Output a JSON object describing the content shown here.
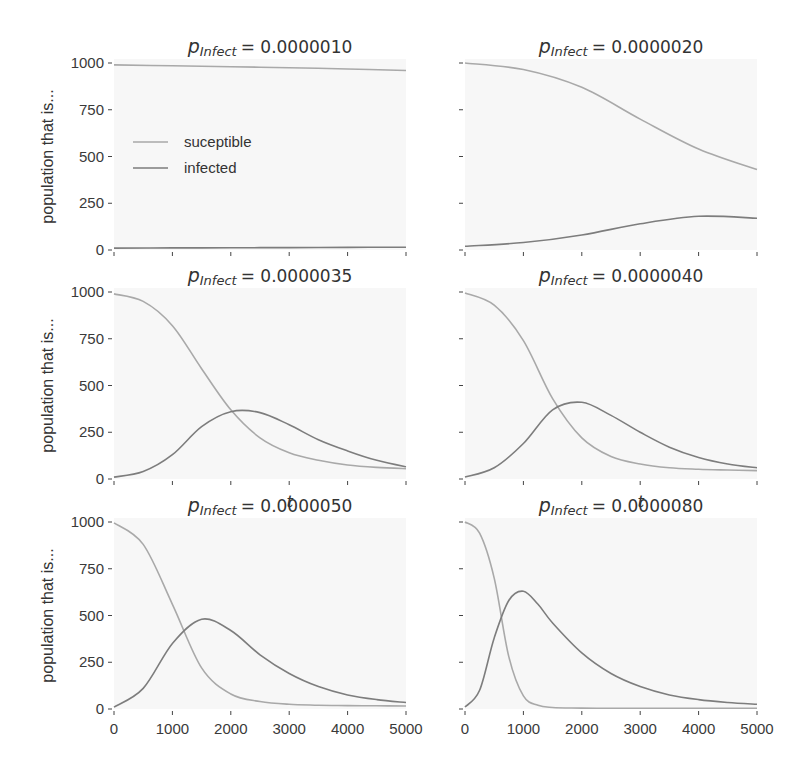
{
  "figure": {
    "ylabel": "population that is...",
    "xlabel": "t",
    "legend": [
      {
        "label": "suceptible",
        "color": "#a9a9a9"
      },
      {
        "label": "infected",
        "color": "#7d7d7d"
      }
    ],
    "colors": {
      "background": "#f7f7f7",
      "susceptible": "#a9a9a9",
      "infected": "#7d7d7d",
      "axis": "#444444"
    }
  },
  "chart_data": [
    {
      "type": "line",
      "title": "p_Infect = 0.0000010",
      "title_prefix": "p",
      "title_sub": "Infect",
      "title_value": "= 0.0000010",
      "xlabel": "",
      "ylabel": "population that is...",
      "xlim": [
        0,
        5000
      ],
      "ylim": [
        0,
        1000
      ],
      "x": [
        0,
        1000,
        2000,
        3000,
        4000,
        5000
      ],
      "series": [
        {
          "name": "suceptible",
          "values": [
            990,
            985,
            980,
            975,
            968,
            960
          ]
        },
        {
          "name": "infected",
          "values": [
            10,
            11,
            12,
            13,
            14,
            15
          ]
        }
      ]
    },
    {
      "type": "line",
      "title": "p_Infect = 0.0000020",
      "title_prefix": "p",
      "title_sub": "Infect",
      "title_value": "= 0.0000020",
      "xlabel": "",
      "ylabel": "",
      "xlim": [
        0,
        5000
      ],
      "ylim": [
        0,
        1000
      ],
      "x": [
        0,
        1000,
        2000,
        3000,
        4000,
        5000
      ],
      "series": [
        {
          "name": "suceptible",
          "values": [
            1000,
            965,
            870,
            700,
            540,
            430
          ]
        },
        {
          "name": "infected",
          "values": [
            20,
            40,
            80,
            140,
            180,
            170
          ]
        }
      ]
    },
    {
      "type": "line",
      "title": "p_Infect = 0.0000035",
      "title_prefix": "p",
      "title_sub": "Infect",
      "title_value": "= 0.0000035",
      "xlabel": "",
      "ylabel": "population that is...",
      "xlim": [
        0,
        5000
      ],
      "ylim": [
        0,
        1000
      ],
      "x": [
        0,
        500,
        1000,
        1500,
        2000,
        2500,
        3000,
        3500,
        4000,
        4500,
        5000
      ],
      "series": [
        {
          "name": "suceptible",
          "values": [
            990,
            950,
            820,
            590,
            370,
            220,
            140,
            100,
            75,
            62,
            55
          ]
        },
        {
          "name": "infected",
          "values": [
            10,
            40,
            130,
            280,
            360,
            355,
            290,
            210,
            150,
            100,
            65
          ]
        }
      ]
    },
    {
      "type": "line",
      "title": "p_Infect = 0.0000040",
      "title_prefix": "p",
      "title_sub": "Infect",
      "title_value": "= 0.0000040",
      "xlabel": "",
      "ylabel": "",
      "xlim": [
        0,
        5000
      ],
      "ylim": [
        0,
        1000
      ],
      "x": [
        0,
        500,
        1000,
        1500,
        2000,
        2500,
        3000,
        3500,
        4000,
        4500,
        5000
      ],
      "series": [
        {
          "name": "suceptible",
          "values": [
            995,
            930,
            740,
            430,
            220,
            120,
            80,
            60,
            52,
            48,
            45
          ]
        },
        {
          "name": "infected",
          "values": [
            10,
            60,
            190,
            370,
            410,
            340,
            250,
            170,
            115,
            80,
            60
          ]
        }
      ]
    },
    {
      "type": "line",
      "title": "p_Infect = 0.0000050",
      "title_prefix": "p",
      "title_sub": "Infect",
      "title_value": "= 0.0000050",
      "xlabel": "t",
      "ylabel": "population that is...",
      "xlim": [
        0,
        5000
      ],
      "ylim": [
        0,
        1000
      ],
      "x": [
        0,
        500,
        1000,
        1500,
        2000,
        2500,
        3000,
        3500,
        4000,
        4500,
        5000
      ],
      "series": [
        {
          "name": "suceptible",
          "values": [
            995,
            880,
            560,
            220,
            80,
            40,
            25,
            20,
            18,
            17,
            16
          ]
        },
        {
          "name": "infected",
          "values": [
            10,
            110,
            350,
            480,
            420,
            290,
            190,
            120,
            75,
            50,
            35
          ]
        }
      ]
    },
    {
      "type": "line",
      "title": "p_Infect = 0.0000080",
      "title_prefix": "p",
      "title_sub": "Infect",
      "title_value": "= 0.0000080",
      "xlabel": "t",
      "ylabel": "",
      "xlim": [
        0,
        5000
      ],
      "ylim": [
        0,
        1000
      ],
      "x": [
        0,
        250,
        500,
        750,
        1000,
        1250,
        1500,
        2000,
        2500,
        3000,
        3500,
        4000,
        4500,
        5000
      ],
      "series": [
        {
          "name": "suceptible",
          "values": [
            1000,
            940,
            700,
            280,
            70,
            20,
            8,
            5,
            4,
            4,
            4,
            4,
            4,
            4
          ]
        },
        {
          "name": "infected",
          "values": [
            10,
            100,
            380,
            580,
            630,
            560,
            460,
            300,
            190,
            120,
            75,
            50,
            35,
            25
          ]
        }
      ]
    }
  ],
  "ticks": {
    "y": [
      "0",
      "250",
      "500",
      "750",
      "1000"
    ],
    "x": [
      "0",
      "1000",
      "2000",
      "3000",
      "4000",
      "5000"
    ]
  }
}
